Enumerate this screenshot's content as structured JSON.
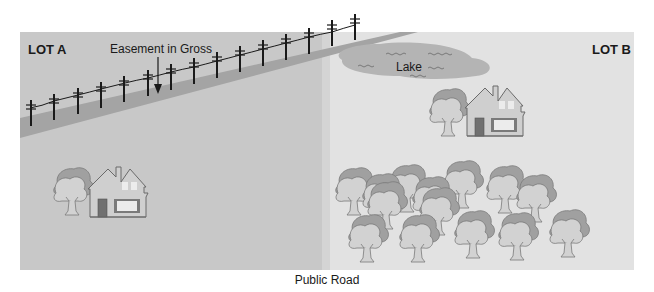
{
  "diagram": {
    "title": "Easement in Gross",
    "colors": {
      "lot_a": "#c8c8c8",
      "lot_b": "#e2e2e2",
      "easement_strip": "#a4a4a4",
      "lake": "#b4b4b4",
      "house_body": "#cfcfcf",
      "house_door": "#707070",
      "tree_dark": "#a0a0a0",
      "tree_light": "#d2d2d2",
      "pole": "#1a1a1a"
    },
    "lots": [
      {
        "id": "lot_a",
        "label": "LOT A"
      },
      {
        "id": "lot_b",
        "label": "LOT B"
      }
    ],
    "labels": {
      "easement": "Easement in Gross",
      "lake": "Lake",
      "road": "Public Road"
    },
    "features": {
      "lot_a": [
        "house",
        "tree",
        "power line easement strip"
      ],
      "lot_b": [
        "lake",
        "house",
        "tree",
        "woods (14 trees)"
      ]
    },
    "power_poles_count": 15
  }
}
